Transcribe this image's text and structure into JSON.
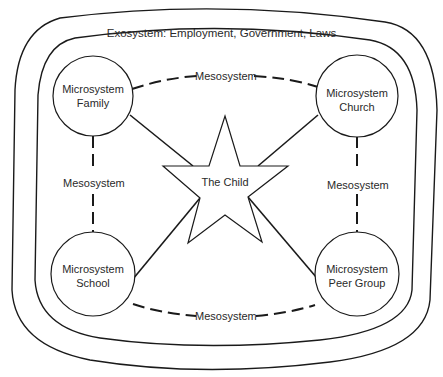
{
  "diagram": {
    "type": "nested-systems",
    "exosystem_label": "Exosystem: Employment, Government, Laws",
    "center": {
      "label": "The Child",
      "shape": "star"
    },
    "microsystems": [
      {
        "id": "family",
        "line1": "Microsystem",
        "line2": "Family"
      },
      {
        "id": "church",
        "line1": "Microsystem",
        "line2": "Church"
      },
      {
        "id": "school",
        "line1": "Microsystem",
        "line2": "School"
      },
      {
        "id": "peer-group",
        "line1": "Microsystem",
        "line2": "Peer Group"
      }
    ],
    "mesosystem_links": [
      {
        "from": "family",
        "to": "church",
        "label": "Mesosystem"
      },
      {
        "from": "family",
        "to": "school",
        "label": "Mesosystem"
      },
      {
        "from": "church",
        "to": "peer-group",
        "label": "Mesosystem"
      },
      {
        "from": "school",
        "to": "peer-group",
        "label": "Mesosystem"
      }
    ],
    "colors": {
      "stroke": "#1a1a1a",
      "background": "#ffffff",
      "text": "#2a2a2a"
    }
  }
}
